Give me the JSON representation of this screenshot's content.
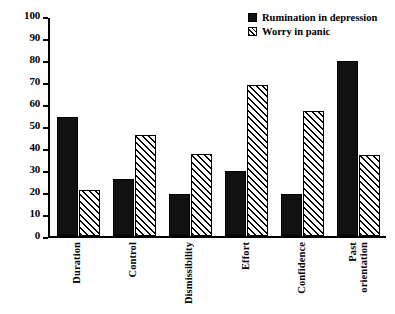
{
  "chart_data": {
    "type": "bar",
    "title": "",
    "xlabel": "",
    "ylabel": "",
    "ylim": [
      0,
      100
    ],
    "yticks": [
      0,
      10,
      20,
      30,
      40,
      50,
      60,
      70,
      80,
      90,
      100
    ],
    "grid": false,
    "legend_position": "top-right",
    "categories": [
      "Duration",
      "Control",
      "Dismissibility",
      "Effort",
      "Confidence",
      "Past\norientation"
    ],
    "series": [
      {
        "name": "Rumination in depression",
        "style": "solid-black",
        "color": "#111111",
        "values": [
          54,
          26,
          19,
          29.5,
          19,
          79.5
        ]
      },
      {
        "name": "Worry in panic",
        "style": "diagonal-hatch",
        "color": "#ffffff",
        "values": [
          21,
          46,
          37.5,
          68.5,
          57,
          37
        ]
      }
    ]
  },
  "legend": {
    "items": [
      {
        "label": "Rumination in depression"
      },
      {
        "label": "Worry in panic"
      }
    ]
  },
  "axis": {
    "y_tick_labels": [
      "100",
      "90",
      "80",
      "70",
      "60",
      "50",
      "40",
      "30",
      "20",
      "10",
      "0"
    ]
  }
}
